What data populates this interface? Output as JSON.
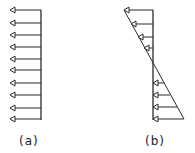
{
  "diagrams": [
    {
      "id": "a",
      "label": "(a)",
      "description": "uniform distributed load - equal length arrows pointing left",
      "base_x": 41,
      "arrows": [
        {
          "y": 10,
          "tip_x": 10
        },
        {
          "y": 23,
          "tip_x": 10
        },
        {
          "y": 35,
          "tip_x": 10
        },
        {
          "y": 47,
          "tip_x": 10
        },
        {
          "y": 59,
          "tip_x": 10
        },
        {
          "y": 70,
          "tip_x": 10
        },
        {
          "y": 83,
          "tip_x": 10
        },
        {
          "y": 95,
          "tip_x": 10
        },
        {
          "y": 108,
          "tip_x": 10
        },
        {
          "y": 119,
          "tip_x": 10
        }
      ]
    },
    {
      "id": "b",
      "label": "(b)",
      "description": "linearly varying load - arrows along diagonal envelope",
      "base_x": 153,
      "top_arrows": [
        {
          "y": 10,
          "tip_x": 124
        },
        {
          "y": 24,
          "tip_x": 131
        },
        {
          "y": 37,
          "tip_x": 138
        },
        {
          "y": 48,
          "tip_x": 144
        }
      ],
      "bottom_arrows": [
        {
          "y": 83,
          "end_x": 164
        },
        {
          "y": 95,
          "end_x": 170
        },
        {
          "y": 107,
          "end_x": 177
        },
        {
          "y": 119,
          "end_x": 184
        }
      ]
    }
  ],
  "colors": {
    "line": "#2a2a2a"
  }
}
